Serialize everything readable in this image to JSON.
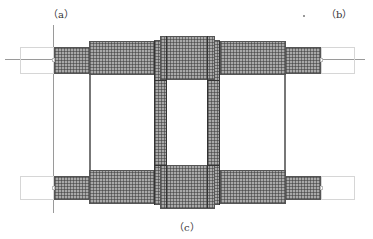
{
  "labels": {
    "a": "（a）",
    "b": "（b）",
    "c": "（c）"
  },
  "diagram": {
    "type": "finite-element mesh of ladder-like frame structure",
    "mesh_color": "#a9a9a9",
    "line_color": "#555555",
    "outline_color": "#d6d6d6",
    "regions": [
      {
        "name": "top-left-stub",
        "kind": "mesh"
      },
      {
        "name": "top-left-beam",
        "kind": "mesh"
      },
      {
        "name": "top-center-block",
        "kind": "mesh"
      },
      {
        "name": "top-right-beam",
        "kind": "mesh"
      },
      {
        "name": "top-right-stub",
        "kind": "mesh"
      },
      {
        "name": "left-pillar",
        "kind": "mesh"
      },
      {
        "name": "right-pillar",
        "kind": "mesh"
      },
      {
        "name": "bottom-left-stub",
        "kind": "mesh"
      },
      {
        "name": "bottom-left-beam",
        "kind": "mesh"
      },
      {
        "name": "bottom-center-block",
        "kind": "mesh"
      },
      {
        "name": "bottom-right-beam",
        "kind": "mesh"
      },
      {
        "name": "bottom-right-stub",
        "kind": "mesh"
      },
      {
        "name": "left-outline-boxes",
        "kind": "outline"
      },
      {
        "name": "right-outline-boxes",
        "kind": "outline"
      }
    ]
  }
}
